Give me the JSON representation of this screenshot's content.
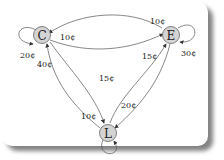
{
  "diagram": {
    "type": "state-transition",
    "nodes": [
      {
        "id": "C",
        "label": "C"
      },
      {
        "id": "E",
        "label": "E"
      },
      {
        "id": "L",
        "label": "L"
      }
    ],
    "edges": [
      {
        "from": "C",
        "to": "C",
        "label": "20¢"
      },
      {
        "from": "E",
        "to": "C",
        "label": "10¢"
      },
      {
        "from": "C",
        "to": "E",
        "label": "10¢"
      },
      {
        "from": "E",
        "to": "E",
        "label": "30¢"
      },
      {
        "from": "L",
        "to": "C",
        "label": "40¢"
      },
      {
        "from": "C",
        "to": "L",
        "label": "15¢"
      },
      {
        "from": "L",
        "to": "E",
        "label": "15¢"
      },
      {
        "from": "E",
        "to": "L",
        "label": "20¢"
      },
      {
        "from": "L",
        "to": "L",
        "label": "10¢"
      }
    ]
  }
}
